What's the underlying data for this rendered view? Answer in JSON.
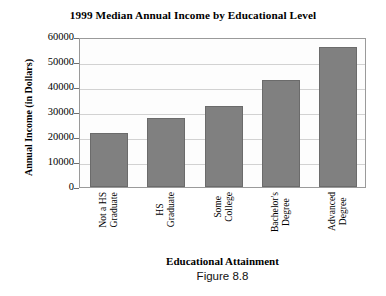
{
  "chart_data": {
    "type": "bar",
    "title": "1999 Median Annual Income by Educational Level",
    "xlabel": "Educational Attainment",
    "ylabel": "Annual Income (in Dollars)",
    "categories": [
      "Not a HS Graduate",
      "HS Graduate",
      "Some College",
      "Bachelor's Degree",
      "Advanced Degree"
    ],
    "category_lines": [
      [
        "Not a HS",
        "Graduate"
      ],
      [
        "HS",
        "Graduate"
      ],
      [
        "Some",
        "College"
      ],
      [
        "Bachelor's",
        "Degree"
      ],
      [
        "Advanced",
        "Degree"
      ]
    ],
    "values": [
      21600,
      27800,
      32500,
      43000,
      56000
    ],
    "ylim": [
      0,
      60000
    ],
    "ytick_values": [
      0,
      10000,
      20000,
      30000,
      40000,
      50000,
      60000
    ],
    "ytick_labels": [
      "0",
      "10000",
      "20000",
      "30000",
      "40000",
      "50000",
      "60000"
    ],
    "grid": true,
    "legend": "none",
    "bar_color": "#808080",
    "bar_edge_color": "#6b6b6b",
    "plot_background": "#fdfdfd",
    "gridline_color": "#d2d2d2"
  },
  "caption": {
    "figure_number": "Figure 8.8"
  }
}
